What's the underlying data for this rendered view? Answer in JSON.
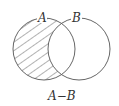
{
  "diagram": {
    "type": "venn",
    "sets": [
      {
        "label": "A",
        "shaded": "only-A-region"
      },
      {
        "label": "B"
      }
    ],
    "caption": "A−B",
    "colors": {
      "stroke": "#555555",
      "hatch": "#555555",
      "background": "#ffffff"
    }
  }
}
